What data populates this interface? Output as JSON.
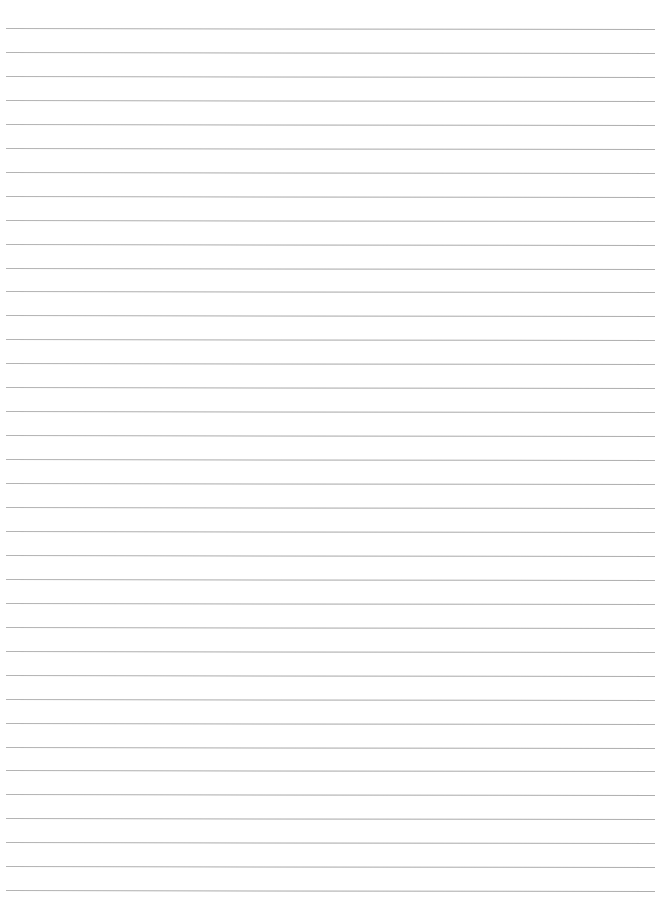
{
  "page": {
    "type": "lined-paper",
    "width": 661,
    "height": 899,
    "background_color": "#ffffff"
  },
  "rules": {
    "count": 37,
    "first_y": 28,
    "spacing": 23.95,
    "x_start": 6,
    "x_end": 655,
    "thickness": 1,
    "tilt_deg": 0.09,
    "color": "#a8a8a8"
  }
}
